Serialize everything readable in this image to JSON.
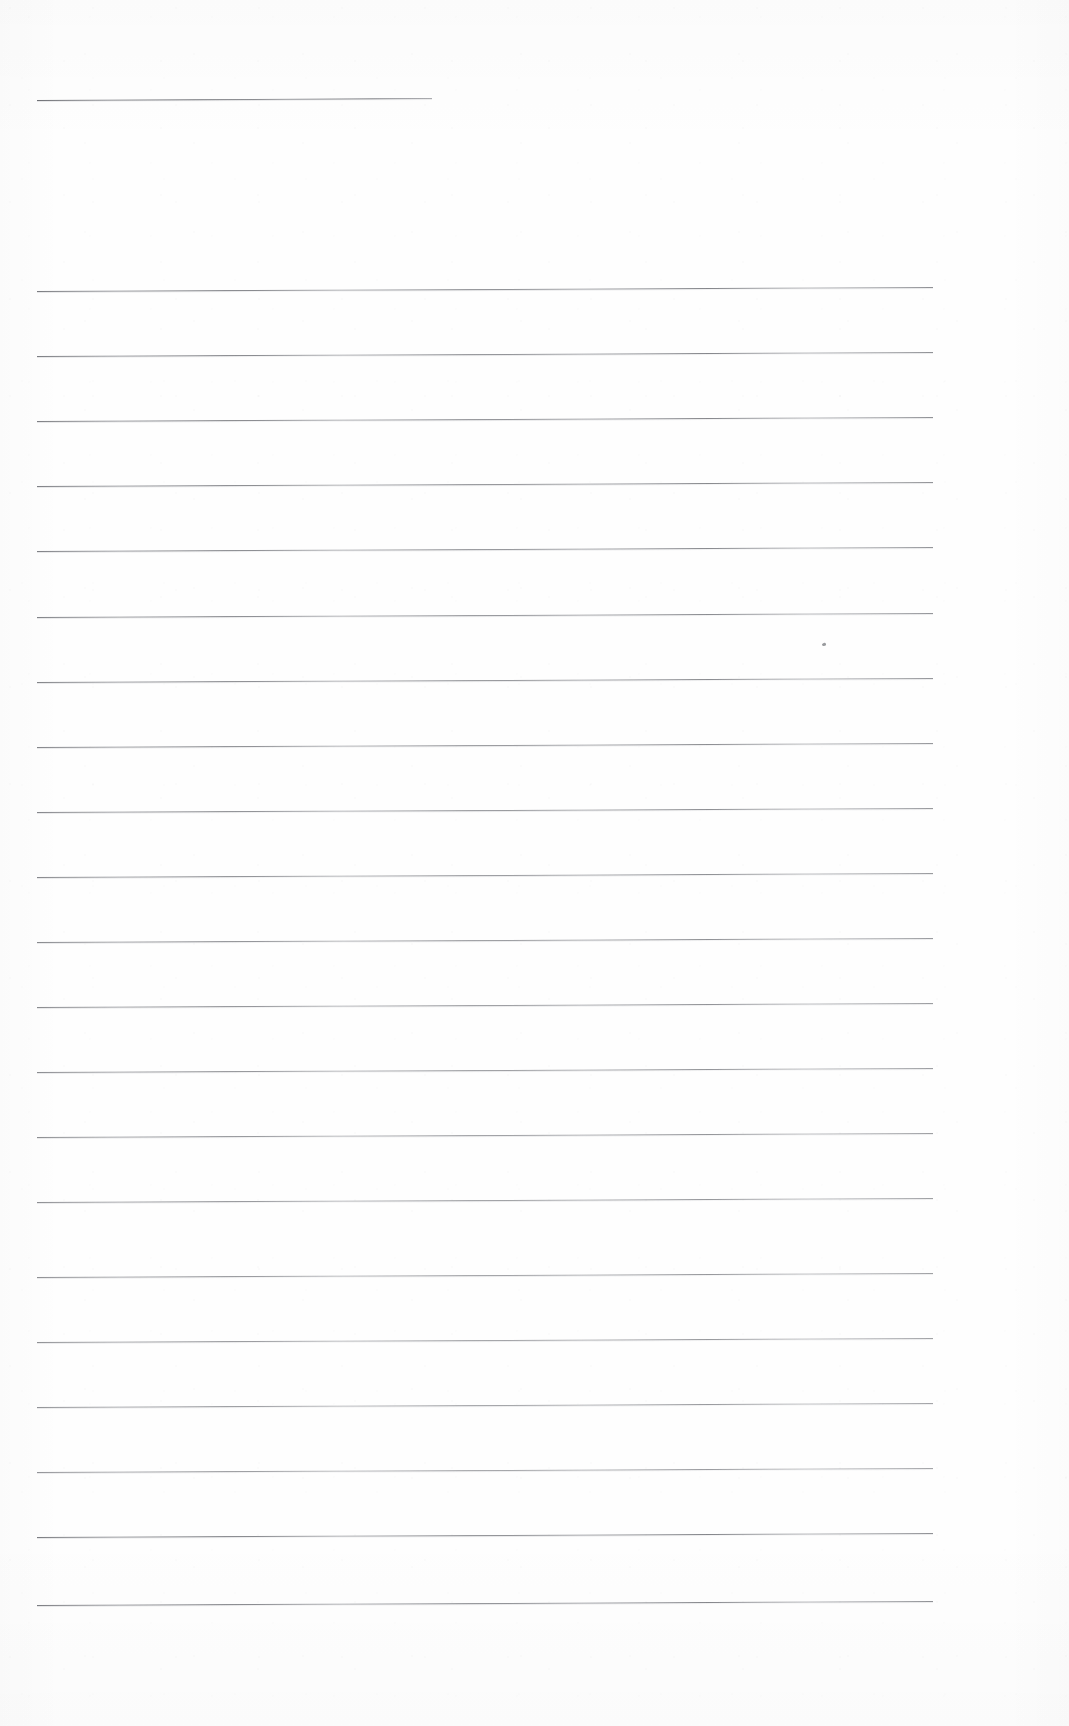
{
  "document": {
    "kind": "scanned-blank-ruled-notepad-page",
    "page_width": 1069,
    "page_height": 1726,
    "paper_color": "#fefefe",
    "rule_color": "#5f6167",
    "text_content": "",
    "visible_text": [],
    "notes": "Blank ruled writing paper scan: one short header rule near the top and a block of full-width horizontal ruled lines. No printed or handwritten text is present."
  },
  "layout": {
    "rule_left_x": 37,
    "rule_right_x": 933,
    "rule_spacing": 65,
    "rule_slant_px": -4,
    "rule_thickness": 1,
    "body_first_rule_y": 291,
    "body_rule_count": 21
  },
  "header_rule": {
    "name": "header-rule",
    "x": 37,
    "y": 100,
    "width": 395,
    "slant_px": -2
  },
  "body_rules": [
    {
      "index": 1,
      "y": 291
    },
    {
      "index": 2,
      "y": 356
    },
    {
      "index": 3,
      "y": 421
    },
    {
      "index": 4,
      "y": 486
    },
    {
      "index": 5,
      "y": 551
    },
    {
      "index": 6,
      "y": 617
    },
    {
      "index": 7,
      "y": 682
    },
    {
      "index": 8,
      "y": 747
    },
    {
      "index": 9,
      "y": 812
    },
    {
      "index": 10,
      "y": 877
    },
    {
      "index": 11,
      "y": 942
    },
    {
      "index": 12,
      "y": 1007
    },
    {
      "index": 13,
      "y": 1072
    },
    {
      "index": 14,
      "y": 1137
    },
    {
      "index": 15,
      "y": 1202
    },
    {
      "index": 16,
      "y": 1277
    },
    {
      "index": 17,
      "y": 1342
    },
    {
      "index": 18,
      "y": 1407
    },
    {
      "index": 19,
      "y": 1472
    },
    {
      "index": 20,
      "y": 1537
    },
    {
      "index": 21,
      "y": 1605
    }
  ],
  "artifacts": [
    {
      "name": "ink-speck",
      "x": 822,
      "y": 643,
      "description": "small stray ink mark between rules"
    }
  ]
}
